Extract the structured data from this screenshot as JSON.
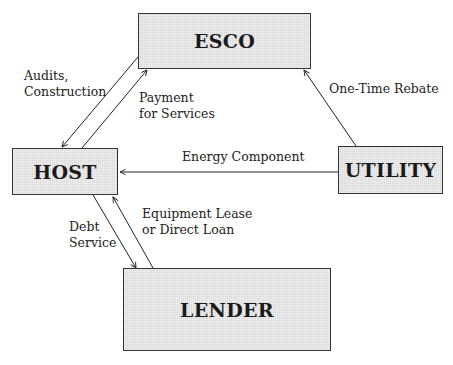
{
  "diagram": {
    "nodes": {
      "esco": "ESCO",
      "host": "HOST",
      "utility": "UTILITY",
      "lender": "LENDER"
    },
    "edges": [
      {
        "from": "ESCO",
        "to": "HOST",
        "label": "Audits,\nConstruction"
      },
      {
        "from": "HOST",
        "to": "ESCO",
        "label": "Payment\nfor Services"
      },
      {
        "from": "UTILITY",
        "to": "ESCO",
        "label": "One-Time Rebate"
      },
      {
        "from": "UTILITY",
        "to": "HOST",
        "label": "Energy Component"
      },
      {
        "from": "HOST",
        "to": "LENDER",
        "label": "Debt\nService"
      },
      {
        "from": "LENDER",
        "to": "HOST",
        "label": "Equipment Lease\nor Direct Loan"
      }
    ]
  }
}
